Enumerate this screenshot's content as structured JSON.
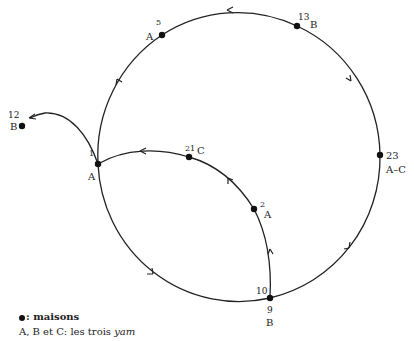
{
  "diagram": {
    "nodes": [
      {
        "id": "1",
        "number": "1",
        "group": "A",
        "x": 98,
        "y": 164
      },
      {
        "id": "5",
        "number": "5",
        "group": "A",
        "x": 162,
        "y": 35
      },
      {
        "id": "13",
        "number": "13",
        "group": "B",
        "x": 297,
        "y": 26
      },
      {
        "id": "23",
        "number": "23",
        "group": "A–C",
        "x": 380,
        "y": 155
      },
      {
        "id": "10-9",
        "number_top": "10",
        "number_bottom": "9",
        "group": "B",
        "x": 270,
        "y": 298
      },
      {
        "id": "2",
        "number": "2",
        "group": "A",
        "x": 254,
        "y": 209
      },
      {
        "id": "21",
        "number": "21",
        "group": "C",
        "x": 189,
        "y": 157
      },
      {
        "id": "12",
        "number": "12",
        "group": "B",
        "x": 22,
        "y": 126
      }
    ],
    "edges": [
      {
        "from": "10-9",
        "to": "23",
        "direction": "counterclockwise-up"
      },
      {
        "from": "23",
        "to": "13"
      },
      {
        "from": "13",
        "to": "5"
      },
      {
        "from": "5",
        "to": "1"
      },
      {
        "from": "1",
        "to": "10-9"
      },
      {
        "from": "10-9",
        "to": "2"
      },
      {
        "from": "2",
        "to": "21"
      },
      {
        "from": "21",
        "to": "1"
      },
      {
        "from": "1",
        "to": "12"
      }
    ]
  },
  "legend": {
    "houses_label": ": maisons",
    "groups_prefix": "A, B et C: les trois ",
    "groups_term": "yam"
  },
  "colors": {
    "line": "#222222",
    "dot": "#111111",
    "background": "#ffffff"
  }
}
